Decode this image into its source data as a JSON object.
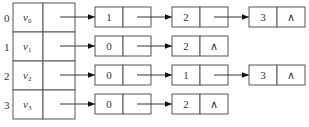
{
  "null_symbol": "∧",
  "vertices": [
    {
      "index": "0",
      "name": "v",
      "subscript": "0",
      "adjacent": [
        "1",
        "2",
        "3"
      ]
    },
    {
      "index": "1",
      "name": "v",
      "subscript": "1",
      "adjacent": [
        "0",
        "2"
      ]
    },
    {
      "index": "2",
      "name": "v",
      "subscript": "2",
      "adjacent": [
        "0",
        "1",
        "3"
      ]
    },
    {
      "index": "3",
      "name": "v",
      "subscript": "3",
      "adjacent": [
        "0",
        "2"
      ]
    }
  ]
}
